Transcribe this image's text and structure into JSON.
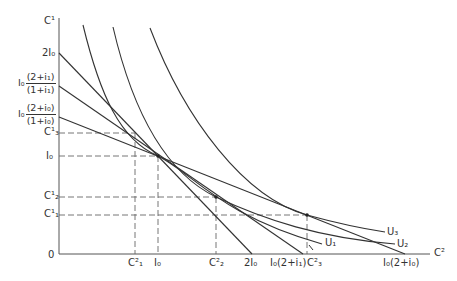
{
  "diagram": {
    "axes": {
      "y_label": "C¹",
      "x_label": "C²",
      "origin_label": "0"
    },
    "y_ticks": [
      {
        "id": "two_i0",
        "label": "2I₀"
      },
      {
        "id": "frac_i1",
        "prefix": "I₀",
        "num": "(2+i₁)",
        "den": "(1+i₁)"
      },
      {
        "id": "frac_i0",
        "prefix": "I₀",
        "num": "(2+i₀)",
        "den": "(1+i₀)"
      },
      {
        "id": "c3_1",
        "label": "C¹₃"
      },
      {
        "id": "i0",
        "label": "I₀"
      },
      {
        "id": "c2_1",
        "label": "C¹₂"
      },
      {
        "id": "c1_1",
        "label": "C¹₁"
      }
    ],
    "x_ticks": [
      {
        "id": "c1_2",
        "label": "C²₁"
      },
      {
        "id": "i0",
        "label": "I₀"
      },
      {
        "id": "c2_2",
        "label": "C²₂"
      },
      {
        "id": "two_i0",
        "label": "2I₀"
      },
      {
        "id": "i0_2_i1",
        "label": "I₀(2+i₁)"
      },
      {
        "id": "c3_2",
        "label": "C²₃"
      },
      {
        "id": "i0_2_i0",
        "label": "I₀(2+i₀)"
      }
    ],
    "curves": [
      {
        "id": "U1",
        "label": "U₁"
      },
      {
        "id": "U2",
        "label": "U₂"
      },
      {
        "id": "U3",
        "label": "U₃"
      }
    ],
    "budget_lines": [
      {
        "from": "2I₀",
        "to": "2I₀"
      },
      {
        "from": "I₀(2+i₁)/(1+i₁)",
        "to": "I₀(2+i₁)"
      },
      {
        "from": "I₀(2+i₀)/(1+i₀)",
        "to": "I₀(2+i₀)"
      }
    ],
    "colors": {
      "line": "#333333",
      "dash": "#555555",
      "background": "#ffffff"
    }
  }
}
